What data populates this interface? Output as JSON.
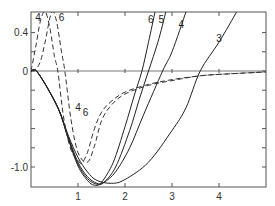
{
  "chart_data": {
    "type": "line",
    "title": "",
    "xlabel": "",
    "ylabel": "",
    "xlim": [
      0,
      5.0
    ],
    "ylim": [
      -1.21,
      0.62
    ],
    "grid": false,
    "legend": "none (curves labeled inline)",
    "x_ticks": [
      1,
      2,
      3,
      4
    ],
    "x_tick_labels": [
      "1",
      "2",
      "3",
      "4"
    ],
    "y_ticks": [
      0.4,
      0,
      -1.0
    ],
    "y_tick_labels": [
      "0.4",
      "0",
      "-1.0"
    ],
    "y_minor_ticks": [
      0.2,
      -0.2,
      -0.4,
      -0.6,
      -0.8
    ],
    "series": [
      {
        "name": "3",
        "style": "solid",
        "points": [
          [
            0,
            0
          ],
          [
            0.15,
            -0.02
          ],
          [
            0.57,
            -0.38
          ],
          [
            0.8,
            -0.68
          ],
          [
            1.0,
            -0.9
          ],
          [
            1.2,
            -1.05
          ],
          [
            1.4,
            -1.14
          ],
          [
            1.72,
            -1.17
          ],
          [
            2.0,
            -1.13
          ],
          [
            2.5,
            -0.95
          ],
          [
            3.0,
            -0.62
          ],
          [
            3.3,
            -0.38
          ],
          [
            3.6,
            0.0
          ],
          [
            4.0,
            0.3
          ],
          [
            4.38,
            0.62
          ]
        ]
      },
      {
        "name": "4",
        "style": "solid",
        "points": [
          [
            0,
            0
          ],
          [
            0.15,
            -0.02
          ],
          [
            0.57,
            -0.38
          ],
          [
            0.8,
            -0.7
          ],
          [
            1.0,
            -0.95
          ],
          [
            1.2,
            -1.1
          ],
          [
            1.4,
            -1.17
          ],
          [
            1.55,
            -1.16
          ],
          [
            1.8,
            -1.05
          ],
          [
            2.1,
            -0.8
          ],
          [
            2.4,
            -0.45
          ],
          [
            2.8,
            0.0
          ],
          [
            3.0,
            0.2
          ],
          [
            3.3,
            0.62
          ]
        ]
      },
      {
        "name": "5",
        "style": "solid",
        "points": [
          [
            0,
            0
          ],
          [
            0.15,
            -0.02
          ],
          [
            0.57,
            -0.38
          ],
          [
            0.8,
            -0.71
          ],
          [
            1.0,
            -0.97
          ],
          [
            1.2,
            -1.12
          ],
          [
            1.4,
            -1.18
          ],
          [
            1.55,
            -1.16
          ],
          [
            1.8,
            -1.0
          ],
          [
            2.1,
            -0.62
          ],
          [
            2.3,
            -0.3
          ],
          [
            2.5,
            0.0
          ],
          [
            2.7,
            0.3
          ],
          [
            2.87,
            0.62
          ]
        ]
      },
      {
        "name": "6",
        "style": "solid",
        "points": [
          [
            0,
            0
          ],
          [
            0.15,
            -0.02
          ],
          [
            0.57,
            -0.38
          ],
          [
            0.8,
            -0.72
          ],
          [
            1.0,
            -0.99
          ],
          [
            1.2,
            -1.14
          ],
          [
            1.35,
            -1.19
          ],
          [
            1.5,
            -1.16
          ],
          [
            1.75,
            -0.95
          ],
          [
            2.0,
            -0.58
          ],
          [
            2.2,
            -0.25
          ],
          [
            2.36,
            0.0
          ],
          [
            2.5,
            0.3
          ],
          [
            2.64,
            0.62
          ]
        ]
      },
      {
        "name": "4 (dashed)",
        "style": "dashed",
        "points": [
          [
            0,
            0
          ],
          [
            0.1,
            0.25
          ],
          [
            0.2,
            0.52
          ],
          [
            0.3,
            0.62
          ],
          [
            0.4,
            0.45
          ],
          [
            0.5,
            0.15
          ],
          [
            0.57,
            0.0
          ],
          [
            0.7,
            -0.5
          ],
          [
            0.85,
            -0.82
          ],
          [
            1.0,
            -0.93
          ],
          [
            1.08,
            -0.96
          ],
          [
            1.2,
            -0.85
          ],
          [
            1.35,
            -0.6
          ],
          [
            1.5,
            -0.43
          ],
          [
            1.7,
            -0.32
          ],
          [
            2.0,
            -0.22
          ],
          [
            2.5,
            -0.14
          ],
          [
            3.0,
            -0.09
          ],
          [
            3.6,
            -0.05
          ],
          [
            4.2,
            -0.03
          ],
          [
            5.0,
            -0.01
          ]
        ]
      },
      {
        "name": "6 (dashed)",
        "style": "dashed",
        "points": [
          [
            0,
            0
          ],
          [
            0.1,
            0.02
          ],
          [
            0.2,
            0.1
          ],
          [
            0.3,
            0.3
          ],
          [
            0.4,
            0.55
          ],
          [
            0.47,
            0.62
          ],
          [
            0.55,
            0.5
          ],
          [
            0.65,
            0.2
          ],
          [
            0.72,
            0.0
          ],
          [
            0.85,
            -0.5
          ],
          [
            1.0,
            -0.85
          ],
          [
            1.2,
            -0.95
          ],
          [
            1.35,
            -0.78
          ],
          [
            1.5,
            -0.52
          ],
          [
            1.7,
            -0.36
          ],
          [
            2.0,
            -0.24
          ],
          [
            2.5,
            -0.15
          ],
          [
            3.0,
            -0.1
          ],
          [
            3.6,
            -0.05
          ],
          [
            4.2,
            -0.03
          ],
          [
            5.0,
            -0.01
          ]
        ]
      }
    ],
    "annotations": [
      {
        "text": "4",
        "x": 0.15,
        "y": 0.52,
        "note": "dashed curve 4 label"
      },
      {
        "text": "6",
        "x": 0.65,
        "y": 0.52,
        "note": "dashed curve 6 label"
      },
      {
        "text": "6",
        "x": 2.55,
        "y": 0.5,
        "note": "solid curve 6 label"
      },
      {
        "text": "5",
        "x": 2.77,
        "y": 0.5,
        "note": "solid curve 5 label"
      },
      {
        "text": "4",
        "x": 3.2,
        "y": 0.45,
        "note": "solid curve 4 label"
      },
      {
        "text": "3",
        "x": 4.0,
        "y": 0.3,
        "note": "solid curve 3 label"
      },
      {
        "text": "4",
        "x": 1.0,
        "y": -0.42,
        "note": "dashed curve 4 label near tail"
      },
      {
        "text": "6",
        "x": 1.16,
        "y": -0.47,
        "note": "dashed curve 6 label near tail"
      }
    ]
  }
}
